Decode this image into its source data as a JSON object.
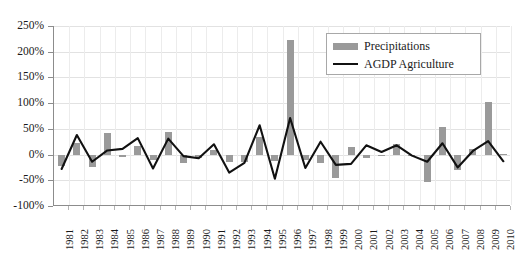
{
  "chart_data": {
    "type": "bar",
    "title": "",
    "subtitle": "",
    "xlabel": "",
    "ylabel": "",
    "ylim": [
      -100,
      250
    ],
    "yticks": [
      250,
      200,
      150,
      100,
      50,
      0,
      -50,
      -100
    ],
    "ytick_labels": [
      "250%",
      "200%",
      "150%",
      "100%",
      "50%",
      "0%",
      "-50%",
      "-100%"
    ],
    "grid": true,
    "legend_position": "top-right",
    "categories": [
      "1981",
      "1982",
      "1983",
      "1984",
      "1985",
      "1986",
      "1987",
      "1988",
      "1989",
      "1990",
      "1991",
      "1992",
      "1993",
      "1994",
      "1995",
      "1996",
      "1997",
      "1998",
      "1999",
      "2000",
      "2001",
      "2002",
      "2003",
      "2004",
      "2005",
      "2006",
      "2007",
      "2008",
      "2009",
      "2010"
    ],
    "series": [
      {
        "name": "Precipitations",
        "type": "bar",
        "color": "#9a9a9a",
        "values": [
          -22,
          23,
          -25,
          41,
          -5,
          17,
          -10,
          43,
          -16,
          -6,
          8,
          -14,
          -15,
          34,
          -13,
          223,
          -10,
          -17,
          -45,
          14,
          -6,
          -3,
          20,
          -3,
          -53,
          54,
          -30,
          11,
          103,
          2
        ]
      },
      {
        "name": "AGDP Agriculture",
        "type": "line",
        "color": "#111111",
        "values": [
          -28,
          38,
          -14,
          8,
          11,
          32,
          -27,
          31,
          -3,
          -7,
          20,
          -35,
          -16,
          57,
          -47,
          71,
          -26,
          25,
          -20,
          -18,
          18,
          5,
          18,
          -2,
          -14,
          22,
          -25,
          7,
          26,
          -13
        ]
      }
    ],
    "legend": [
      {
        "label": "Precipitations",
        "marker": "bar-swatch",
        "color": "#9a9a9a"
      },
      {
        "label": "AGDP Agriculture",
        "marker": "line-swatch",
        "color": "#111111"
      }
    ]
  }
}
